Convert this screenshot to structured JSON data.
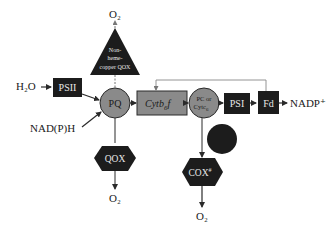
{
  "diagram": {
    "type": "electron-transport-pathway",
    "colors": {
      "dark_node": "#1c1c1c",
      "grey_node": "#8a8a8a",
      "line": "#2a2a2a",
      "dashed_line": "#888888",
      "background": "#ffffff"
    },
    "inputs": {
      "h2o": "H₂O",
      "nadph": "NAD(P)H"
    },
    "nodes": {
      "psii": "PSII",
      "pq": "PQ",
      "cytb6f": "Cytb",
      "cytb6f_sub": "6",
      "cytb6f_suffix": "f",
      "pc_line1": "PC or",
      "pc_line2": "Cytc",
      "pc_sub": "6",
      "psi": "PSI",
      "fd": "Fd",
      "nadp": "NADP⁺",
      "nonheme_line1": "Non-",
      "nonheme_line2": "heme-",
      "nonheme_line3": "copper QOX",
      "qox": "QOX",
      "cox": "COX",
      "cox_sup": "#"
    },
    "outputs": {
      "o2_top": "O₂",
      "o2_qox": "O₂",
      "o2_cox": "O₂"
    }
  }
}
